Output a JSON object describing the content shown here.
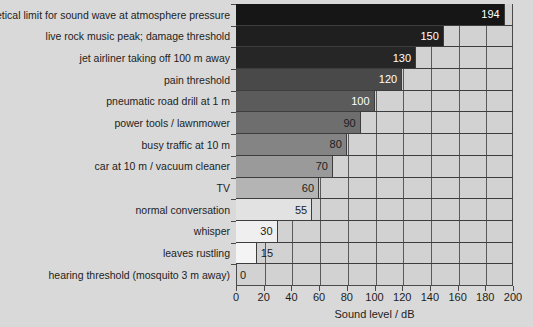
{
  "chart_data": {
    "type": "bar",
    "orientation": "horizontal",
    "title": "",
    "xlabel": "Sound level / dB",
    "ylabel": "",
    "xlim": [
      0,
      200
    ],
    "xticks": [
      0,
      20,
      40,
      60,
      80,
      100,
      120,
      140,
      160,
      180,
      200
    ],
    "grid": "vertical",
    "legend": "none",
    "categories": [
      "theoretical limit for sound wave at atmosphere pressure",
      "live rock music peak; damage threshold",
      "jet airliner taking off 100 m away",
      "pain threshold",
      "pneumatic road drill at 1 m",
      "power tools / lawnmower",
      "busy traffic at 10 m",
      "car at 10 m / vacuum cleaner",
      "TV",
      "normal conversation",
      "whisper",
      "leaves rustling",
      "hearing threshold (mosquito 3 m away)"
    ],
    "values": [
      194,
      150,
      130,
      120,
      100,
      90,
      80,
      70,
      60,
      55,
      30,
      15,
      0
    ],
    "bar_colors": [
      "#161616",
      "#1f1f1f",
      "#262626",
      "#494949",
      "#5b5b5b",
      "#6e6e6e",
      "#848484",
      "#9a9a9a",
      "#b4b4b4",
      "#e2e2e2",
      "#efefef",
      "#f4f4f4",
      "#f6f6f6"
    ],
    "value_label_colors": [
      "#ffffff",
      "#ffffff",
      "#ffffff",
      "#ffffff",
      "#ffffff",
      "#1d1d1d",
      "#1d1d1d",
      "#1d1d1d",
      "#1d1d1d",
      "#1d1d1d",
      "#1d1d1d",
      "#1d1d1d",
      "#1d1d1d"
    ],
    "background_color": "#d9d9d9",
    "plot_background_color": "#d2d2d2",
    "axis_color": "#4a4a4a"
  }
}
